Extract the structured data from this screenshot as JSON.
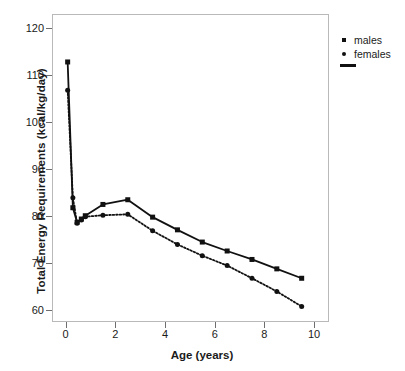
{
  "chart_data": {
    "type": "line",
    "title": "",
    "xlabel": "Age (years)",
    "ylabel": "Total Energy Requirements (kcal/kg/day)",
    "xlim": [
      -0.55,
      10.6
    ],
    "ylim": [
      57.5,
      123.0
    ],
    "xticks": [
      0,
      2,
      4,
      6,
      8,
      10
    ],
    "yticks": [
      60,
      70,
      80,
      90,
      100,
      110,
      120
    ],
    "xtick_labels": [
      "0",
      "2",
      "4",
      "6",
      "8",
      "10"
    ],
    "ytick_labels": [
      "60",
      "70",
      "80",
      "90",
      "100",
      "110",
      "120"
    ],
    "grid": false,
    "legend_position": "outside-top-right",
    "series": [
      {
        "name": "males",
        "marker": "square",
        "linestyle": "solid",
        "color": "#111111",
        "x": [
          0.08,
          0.29,
          0.46,
          0.63,
          0.79,
          1.5,
          2.5,
          3.5,
          4.5,
          5.5,
          6.5,
          7.5,
          8.5,
          9.5
        ],
        "y": [
          112.8,
          81.8,
          78.7,
          79.4,
          80.1,
          82.5,
          83.5,
          79.8,
          77.1,
          74.5,
          72.6,
          70.8,
          68.8,
          66.8
        ]
      },
      {
        "name": "females",
        "marker": "circle",
        "linestyle": "dotted",
        "color": "#111111",
        "x": [
          0.08,
          0.29,
          0.46,
          0.63,
          0.79,
          1.5,
          2.5,
          3.5,
          4.5,
          5.5,
          6.5,
          7.5,
          8.5,
          9.5
        ],
        "y": [
          106.8,
          83.9,
          78.5,
          79.2,
          79.9,
          80.2,
          80.4,
          76.9,
          74.0,
          71.6,
          69.5,
          66.8,
          64.0,
          60.8
        ]
      }
    ]
  },
  "legend": {
    "entries": [
      {
        "label": "males",
        "marker": "square"
      },
      {
        "label": "females",
        "marker": "circle"
      }
    ],
    "line_key": ""
  },
  "caption": {
    "sliver_text": ""
  }
}
